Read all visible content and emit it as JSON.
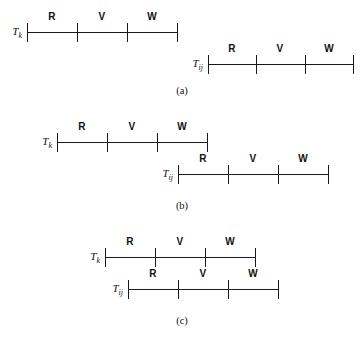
{
  "figure": {
    "segment_labels": [
      "R",
      "V",
      "W"
    ],
    "panels": [
      {
        "id": "a",
        "caption": "(a)",
        "caption_y": 84,
        "relation": "disjoint",
        "timelines": [
          {
            "name": "Tk",
            "label_main": "T",
            "label_sub": "k",
            "x": 27,
            "y": 18,
            "width": 150,
            "ticks": [
              0,
              50,
              100,
              150
            ],
            "segments": [
              {
                "label": "R",
                "center": 25
              },
              {
                "label": "V",
                "center": 75
              },
              {
                "label": "W",
                "center": 125
              }
            ]
          },
          {
            "name": "Tij",
            "label_main": "T",
            "label_sub": "ij",
            "x": 208,
            "y": 50,
            "width": 145,
            "ticks": [
              0,
              48,
              97,
              145
            ],
            "segments": [
              {
                "label": "R",
                "center": 24
              },
              {
                "label": "V",
                "center": 72
              },
              {
                "label": "W",
                "center": 121
              }
            ]
          }
        ]
      },
      {
        "id": "b",
        "caption": "(b)",
        "caption_y": 199,
        "relation": "partial-overlap",
        "timelines": [
          {
            "name": "Tk",
            "label_main": "T",
            "label_sub": "k",
            "x": 57,
            "y": 128,
            "width": 150,
            "ticks": [
              0,
              50,
              100,
              150
            ],
            "segments": [
              {
                "label": "R",
                "center": 25
              },
              {
                "label": "V",
                "center": 75
              },
              {
                "label": "W",
                "center": 125
              }
            ]
          },
          {
            "name": "Tij",
            "label_main": "T",
            "label_sub": "ij",
            "x": 178,
            "y": 160,
            "width": 150,
            "ticks": [
              0,
              50,
              100,
              150
            ],
            "segments": [
              {
                "label": "R",
                "center": 25
              },
              {
                "label": "V",
                "center": 75
              },
              {
                "label": "W",
                "center": 125
              }
            ]
          }
        ]
      },
      {
        "id": "c",
        "caption": "(c)",
        "caption_y": 314,
        "relation": "near-coincident",
        "timelines": [
          {
            "name": "Tk",
            "label_main": "T",
            "label_sub": "k",
            "x": 105,
            "y": 243,
            "width": 150,
            "ticks": [
              0,
              50,
              100,
              150
            ],
            "segments": [
              {
                "label": "R",
                "center": 25
              },
              {
                "label": "V",
                "center": 75
              },
              {
                "label": "W",
                "center": 125
              }
            ]
          },
          {
            "name": "Tij",
            "label_main": "T",
            "label_sub": "ij",
            "x": 128,
            "y": 275,
            "width": 150,
            "ticks": [
              0,
              50,
              100,
              150
            ],
            "segments": [
              {
                "label": "R",
                "center": 25
              },
              {
                "label": "V",
                "center": 75
              },
              {
                "label": "W",
                "center": 125
              }
            ]
          }
        ]
      }
    ]
  },
  "colors": {
    "ink": "#1a1a1a",
    "background": "#ffffff"
  }
}
